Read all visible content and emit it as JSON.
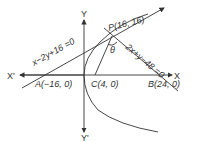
{
  "diagram": {
    "axes": {
      "x_pos_label": "X",
      "x_neg_label": "X'",
      "y_pos_label": "Y",
      "y_neg_label": "Y'"
    },
    "points": {
      "A": "A(−16, 0)",
      "B": "B(24, 0)",
      "C": "C(4, 0)",
      "P": "P(16, 16)"
    },
    "lines": {
      "tangent": "x−2y+16 =0",
      "normal": "2x+y−48 =0"
    },
    "angle_label": "θ"
  }
}
